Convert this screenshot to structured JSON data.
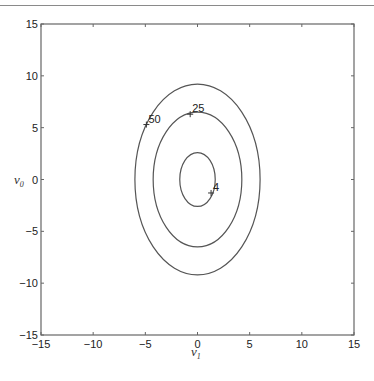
{
  "chart_data": {
    "type": "contour",
    "title": "",
    "xlabel": "v_1",
    "ylabel": "v_0",
    "xlim": [
      -15,
      15
    ],
    "ylim": [
      -15,
      15
    ],
    "xticks": [
      -15,
      -10,
      -5,
      0,
      5,
      10,
      15
    ],
    "yticks": [
      -15,
      -10,
      -5,
      0,
      5,
      10,
      15
    ],
    "grid": false,
    "legend": null,
    "contours": [
      {
        "level": 4,
        "center": [
          0,
          0
        ],
        "semi_axis_x": 1.7,
        "semi_axis_y": 2.6,
        "label": "4",
        "label_point": [
          1.3,
          -1.3
        ]
      },
      {
        "level": 25,
        "center": [
          0,
          0
        ],
        "semi_axis_x": 4.25,
        "semi_axis_y": 6.5,
        "label": "25",
        "label_point": [
          -0.7,
          6.3
        ]
      },
      {
        "level": 50,
        "center": [
          0,
          0
        ],
        "semi_axis_x": 6.0,
        "semi_axis_y": 9.2,
        "label": "50",
        "label_point": [
          -4.9,
          5.3
        ]
      }
    ]
  },
  "labels": {
    "xaxis": "v",
    "xaxis_sub": "1",
    "yaxis": "v",
    "yaxis_sub": "0"
  },
  "colors": {
    "line": "#555555",
    "axis": "#666666"
  }
}
